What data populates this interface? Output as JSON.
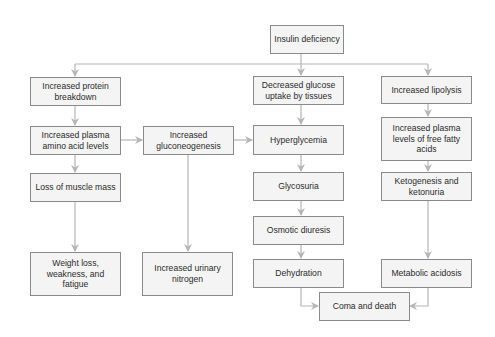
{
  "diagram": {
    "colors": {
      "box_fill": "#f4f4f4",
      "box_border": "#8a8a8a",
      "arrow": "#b5b5b5",
      "text": "#2b2b2b"
    },
    "nodes": {
      "insulin_deficiency": "Insulin deficiency",
      "protein_breakdown": "Increased protein breakdown",
      "plasma_amino_acids": "Increased plasma amino acid levels",
      "muscle_loss": "Loss of muscle mass",
      "weight_loss": "Weight loss, weakness, and fatigue",
      "gluconeogenesis": "Increased gluconeogenesis",
      "urinary_nitrogen": "Increased urinary nitrogen",
      "glucose_uptake": "Decreased glucose uptake by tissues",
      "hyperglycemia": "Hyperglycemia",
      "glycosuria": "Glycosuria",
      "osmotic_diuresis": "Osmotic diuresis",
      "dehydration": "Dehydration",
      "lipolysis": "Increased lipolysis",
      "free_fatty_acids": "Increased plasma levels of free fatty acids",
      "ketogenesis": "Ketogenesis and ketonuria",
      "metabolic_acidosis": "Metabolic acidosis",
      "coma_death": "Coma and death"
    },
    "edges": [
      [
        "insulin_deficiency",
        "protein_breakdown"
      ],
      [
        "insulin_deficiency",
        "glucose_uptake"
      ],
      [
        "insulin_deficiency",
        "lipolysis"
      ],
      [
        "protein_breakdown",
        "plasma_amino_acids"
      ],
      [
        "plasma_amino_acids",
        "gluconeogenesis"
      ],
      [
        "plasma_amino_acids",
        "muscle_loss"
      ],
      [
        "muscle_loss",
        "weight_loss"
      ],
      [
        "gluconeogenesis",
        "hyperglycemia"
      ],
      [
        "gluconeogenesis",
        "urinary_nitrogen"
      ],
      [
        "glucose_uptake",
        "hyperglycemia"
      ],
      [
        "hyperglycemia",
        "glycosuria"
      ],
      [
        "glycosuria",
        "osmotic_diuresis"
      ],
      [
        "osmotic_diuresis",
        "dehydration"
      ],
      [
        "dehydration",
        "coma_death"
      ],
      [
        "lipolysis",
        "free_fatty_acids"
      ],
      [
        "free_fatty_acids",
        "ketogenesis"
      ],
      [
        "ketogenesis",
        "metabolic_acidosis"
      ],
      [
        "metabolic_acidosis",
        "coma_death"
      ]
    ]
  }
}
